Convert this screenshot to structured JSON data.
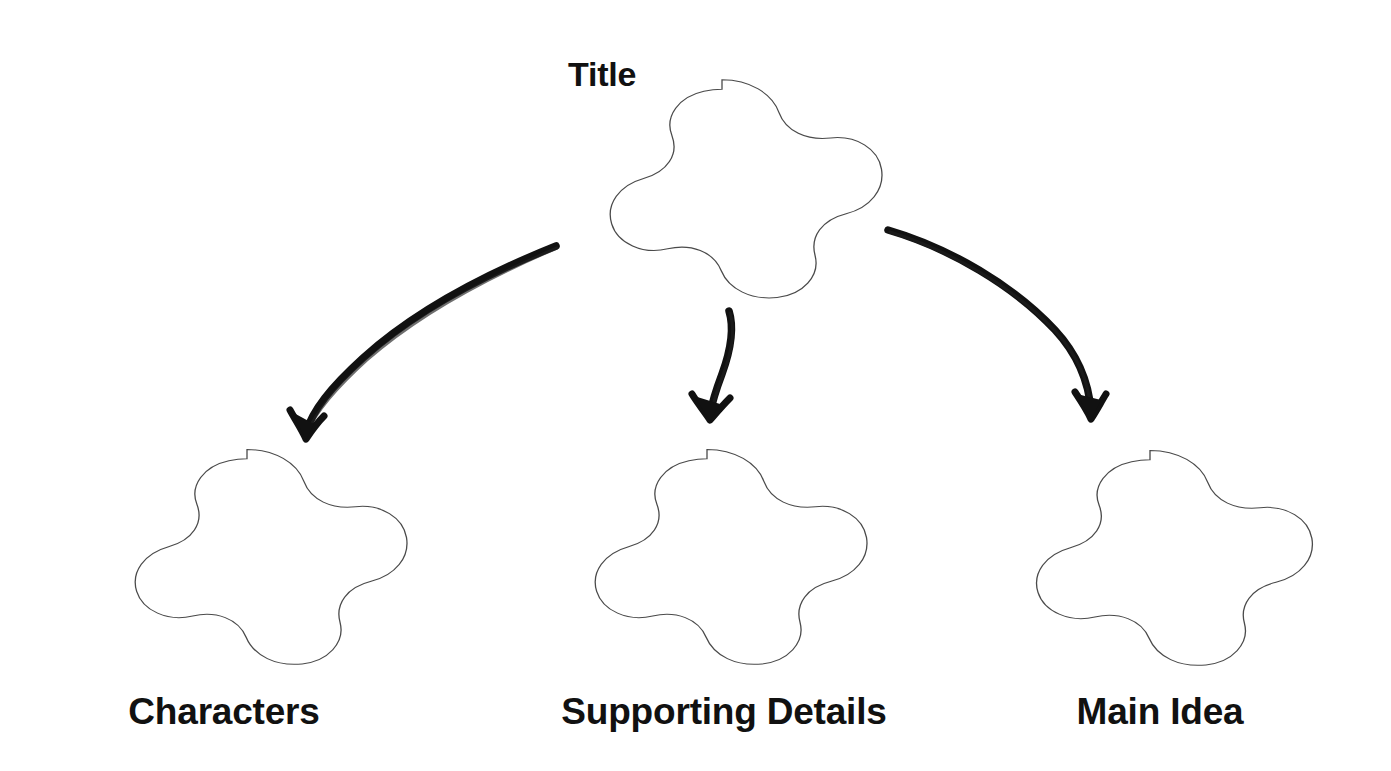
{
  "page": {
    "kind": "graphic-organizer-worksheet",
    "background_color": "#ffffff",
    "width": 1391,
    "height": 771
  },
  "style": {
    "shape_outline_color": "#4a4a4a",
    "shape_fill_color": "#ffffff",
    "arrow_color": "#111111",
    "text_color": "#111111"
  },
  "nodes": {
    "root": {
      "label": "Title",
      "shape": "five-lobed-flower",
      "label_position": "outside-top-left",
      "center_x": 722,
      "center_y": 188,
      "radius_x": 172,
      "radius_y": 135
    },
    "children": [
      {
        "label": "Characters",
        "shape": "five-lobed-flower",
        "label_position": "below",
        "center_x": 247,
        "center_y": 556,
        "radius_x": 172,
        "radius_y": 133
      },
      {
        "label": "Supporting Details",
        "shape": "five-lobed-flower",
        "label_position": "below",
        "center_x": 707,
        "center_y": 556,
        "radius_x": 172,
        "radius_y": 133
      },
      {
        "label": "Main Idea",
        "shape": "five-lobed-flower",
        "label_position": "below",
        "center_x": 1150,
        "center_y": 557,
        "radius_x": 172,
        "radius_y": 133
      }
    ]
  },
  "connectors": [
    {
      "name": "arrow-to-characters",
      "from": "Title",
      "to": "Characters",
      "style": "hand-drawn-curved-arrow",
      "start_x": 556,
      "start_y": 246,
      "end_x": 306,
      "end_y": 437
    },
    {
      "name": "arrow-to-supporting-details",
      "from": "Title",
      "to": "Supporting Details",
      "style": "hand-drawn-curved-arrow",
      "start_x": 728,
      "start_y": 311,
      "end_x": 710,
      "end_y": 418
    },
    {
      "name": "arrow-to-main-idea",
      "from": "Title",
      "to": "Main Idea",
      "style": "hand-drawn-curved-arrow",
      "start_x": 888,
      "start_y": 229,
      "end_x": 1091,
      "end_y": 417
    }
  ],
  "labels": {
    "title": "Title",
    "characters": "Characters",
    "supporting_details": "Supporting Details",
    "main_idea": "Main Idea"
  }
}
